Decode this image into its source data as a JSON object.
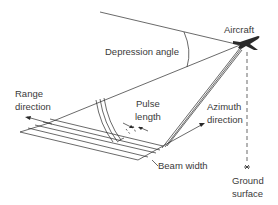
{
  "diagram": {
    "labels": {
      "aircraft": "Aircraft",
      "depression_angle": "Depression angle",
      "range_direction_1": "Range",
      "range_direction_2": "direction",
      "pulse_length_1": "Pulse",
      "pulse_length_2": "length",
      "azimuth_direction_1": "Azimuth",
      "azimuth_direction_2": "direction",
      "beam_width": "Beam width",
      "ground_surface_1": "Ground",
      "ground_surface_2": "surface"
    },
    "colors": {
      "line": "#2a2a2a",
      "text": "#3a3a3a",
      "background": "#ffffff"
    }
  }
}
